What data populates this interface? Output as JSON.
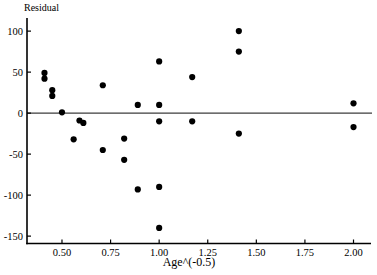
{
  "window": {
    "background": "#ffffff"
  },
  "chart_data": {
    "type": "scatter",
    "title": "",
    "ylabel": "Residual",
    "xlabel": "Age^(-0.5)",
    "x_tick_labels": [
      "0.50",
      "0.75",
      "1.00",
      "1.25",
      "1.50",
      "1.75",
      "2.00"
    ],
    "x_tick_values": [
      0.5,
      0.75,
      1.0,
      1.25,
      1.5,
      1.75,
      2.0
    ],
    "y_tick_labels": [
      "100",
      "50",
      "0",
      "-50",
      "-100",
      "-150"
    ],
    "y_tick_values": [
      100,
      50,
      0,
      -50,
      -100,
      -150
    ],
    "xlim": [
      0.32,
      2.09
    ],
    "ylim": [
      -159,
      116
    ],
    "grid": false,
    "legend": false,
    "zero_reference_line": 0,
    "marker": {
      "shape": "filled-circle",
      "radius_px": 3.1,
      "color": "#000000"
    },
    "axis_color": "#000000",
    "zero_line_color": "#3d3d3d",
    "points": [
      {
        "x": 0.41,
        "y": 49
      },
      {
        "x": 0.41,
        "y": 42
      },
      {
        "x": 0.45,
        "y": 28
      },
      {
        "x": 0.45,
        "y": 21
      },
      {
        "x": 0.5,
        "y": 1
      },
      {
        "x": 0.56,
        "y": -32
      },
      {
        "x": 0.59,
        "y": -9
      },
      {
        "x": 0.61,
        "y": -12
      },
      {
        "x": 0.71,
        "y": 34
      },
      {
        "x": 0.71,
        "y": -45
      },
      {
        "x": 0.82,
        "y": -31
      },
      {
        "x": 0.82,
        "y": -57
      },
      {
        "x": 0.89,
        "y": 10
      },
      {
        "x": 0.89,
        "y": -93
      },
      {
        "x": 1.0,
        "y": 63
      },
      {
        "x": 1.0,
        "y": 10
      },
      {
        "x": 1.0,
        "y": -10
      },
      {
        "x": 1.0,
        "y": -90
      },
      {
        "x": 1.0,
        "y": -140
      },
      {
        "x": 1.17,
        "y": 44
      },
      {
        "x": 1.17,
        "y": -10
      },
      {
        "x": 1.41,
        "y": 100
      },
      {
        "x": 1.41,
        "y": 75
      },
      {
        "x": 1.41,
        "y": -25
      },
      {
        "x": 2.0,
        "y": 12
      },
      {
        "x": 2.0,
        "y": -17
      }
    ]
  }
}
